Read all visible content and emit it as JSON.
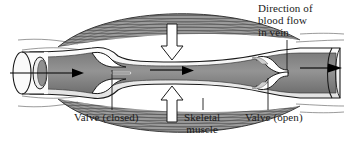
{
  "figure": {
    "background_color": "#ffffff",
    "width": 349,
    "height": 146
  },
  "labels": {
    "direction_line1": "Direction of",
    "direction_line2": "blood flow",
    "direction_line3": "in vein",
    "valve_closed": "Valve (closed)",
    "skeletal_line1": "Skeletal",
    "skeletal_line2": "muscle",
    "valve_open": "Valve (open)"
  },
  "colors": {
    "outline": "#1a1a1a",
    "blood_lumen": "#8a8a8a",
    "vessel_wall": "#f2f2f2",
    "muscle_fill": "#9a9a9a",
    "muscle_striation": "#4a4a4a",
    "compression_arrow_fill": "#ffffff",
    "flow_arrow": "#000000",
    "text": "#1a1a1a",
    "leader_line": "#1a1a1a"
  },
  "elements": {
    "vein": "longitudinal cut-away vein running left to right",
    "vein_cut_end": "open cylindrical cross-section at left showing wall thickness",
    "valve_closed_desc": "two valve leaflets meeting at midline, sinus bulges on each side",
    "valve_open_desc": "two valve leaflets folded back against vessel wall",
    "muscle_upper": "spindle-shaped striated skeletal muscle belly above the vein",
    "muscle_lower": "spindle-shaped striated skeletal muscle belly below the vein",
    "compression_arrow_top": "white down arrow showing muscle squeezing vein",
    "compression_arrow_bottom": "white up arrow showing muscle squeezing vein",
    "flow_arrow_left": "black arrow inside lumen pointing right",
    "flow_arrow_middle": "black arrow inside lumen pointing right",
    "flow_arrow_right": "black arrow exiting vein to the right"
  }
}
